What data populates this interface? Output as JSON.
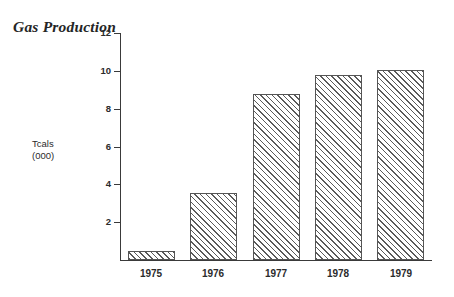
{
  "chart_data": {
    "type": "bar",
    "title": "Gas Production",
    "xlabel": "",
    "ylabel": "Tcals\n(000)",
    "ylabel_lines": [
      "Tcals",
      "(000)"
    ],
    "categories": [
      "1975",
      "1976",
      "1977",
      "1978",
      "1979"
    ],
    "values": [
      0.45,
      3.55,
      8.75,
      9.8,
      10.05
    ],
    "ylim": [
      0,
      12
    ],
    "ytick_labels": [
      "12",
      "10",
      "8",
      "6",
      "4",
      "2"
    ],
    "ytick_values": [
      12,
      10,
      8,
      6,
      4,
      2
    ],
    "grid": false,
    "legend": false,
    "bar_fill": "diagonal-hatch",
    "bar_edge_color": "#555555",
    "hatch_color": "#5a5a5a",
    "background": "#ffffff",
    "axis_color": "#3a3a3a"
  }
}
